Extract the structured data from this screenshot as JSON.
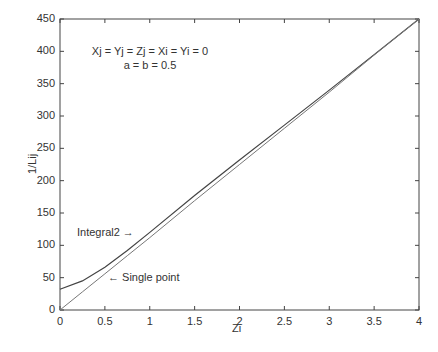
{
  "chart_data": {
    "type": "line",
    "title": "",
    "xlabel": "Zi",
    "ylabel": "1/Lij",
    "xlim": [
      0,
      4
    ],
    "ylim": [
      0,
      450
    ],
    "xticks": [
      "0",
      "0.5",
      "1",
      "1.5",
      "2",
      "2.5",
      "3",
      "3.5",
      "4"
    ],
    "yticks": [
      "0",
      "50",
      "100",
      "150",
      "200",
      "250",
      "300",
      "350",
      "400",
      "450"
    ],
    "grid": false,
    "annotations": [
      "Xj = Yj = Zj = Xi = Yi = 0",
      "a = b = 0.5"
    ],
    "x": [
      0,
      0.25,
      0.5,
      0.75,
      1,
      1.5,
      2,
      2.5,
      3,
      3.5,
      4
    ],
    "series": [
      {
        "name": "Integral2",
        "label": "Integral2 →",
        "values": [
          32,
          45,
          66,
          92,
          120,
          177,
          232,
          286,
          340,
          395,
          450
        ]
      },
      {
        "name": "Single point",
        "label": "← Single point",
        "values": [
          0,
          28,
          56,
          84,
          112,
          169,
          225,
          281,
          337,
          394,
          450
        ]
      }
    ]
  }
}
